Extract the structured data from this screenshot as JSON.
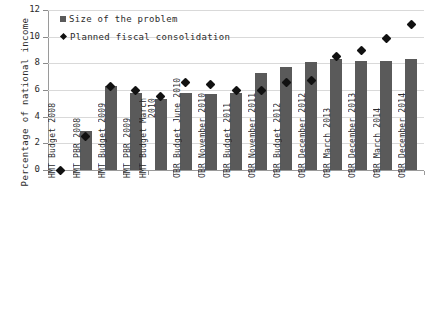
{
  "chart_data": {
    "type": "bar",
    "title": "",
    "xlabel": "",
    "ylabel": "Percentage of national income",
    "ylim": [
      0,
      12
    ],
    "yticks": [
      0,
      2,
      4,
      6,
      8,
      10,
      12
    ],
    "grid": true,
    "legend_position": "top-left",
    "categories": [
      "HMT Budget 2008",
      "HMT PBR 2008",
      "HMT Budget 2009",
      "HMT PBR 2009",
      "HMT Budget March 2010",
      "OBR Budget June 2010",
      "OBR November 2010",
      "OBR Budget 2011",
      "OBR November 2011",
      "OBR Budget 2012",
      "OBR December 2012",
      "OBR March 2013",
      "OBR December 2013",
      "OBR March 2014",
      "OBR December 2014"
    ],
    "series": [
      {
        "name": "Size of the problem",
        "type": "bar",
        "color": "#5a5a5a",
        "values": [
          0,
          2.9,
          6.3,
          5.8,
          5.3,
          5.8,
          5.7,
          5.8,
          7.3,
          7.7,
          8.1,
          8.3,
          8.2,
          8.2,
          8.3
        ]
      },
      {
        "name": "Planned fiscal consolidation",
        "type": "scatter",
        "color": "#111111",
        "marker": "diamond",
        "values": [
          0,
          2.5,
          6.3,
          6.0,
          5.5,
          6.6,
          6.4,
          6.0,
          6.0,
          6.6,
          6.7,
          8.5,
          9.0,
          9.9,
          10.9
        ]
      }
    ]
  },
  "legend": {
    "items": [
      {
        "label": "Size of the problem",
        "marker": "square"
      },
      {
        "label": "Planned fiscal\nconsolidation",
        "marker": "diamond"
      }
    ]
  },
  "axis": {
    "y_title": "Percentage of national income"
  }
}
